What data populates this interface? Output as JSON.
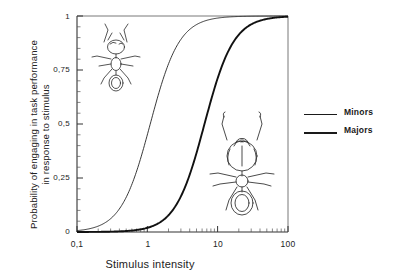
{
  "chart_data": {
    "type": "line",
    "title": "",
    "xlabel": "Stimulus intensity",
    "ylabel_line1": "Probability of engaging in task performance",
    "ylabel_line2": "in response to stimulus",
    "xscale": "log",
    "xlim": [
      0.1,
      100
    ],
    "ylim": [
      0,
      1
    ],
    "grid": false,
    "legend_position": "right",
    "xticks": [
      "0,1",
      "1",
      "10",
      "100"
    ],
    "xtick_values": [
      0.1,
      1,
      10,
      100
    ],
    "yticks": [
      "0",
      "0,25",
      "0,5",
      "0,75",
      "1"
    ],
    "ytick_values": [
      0,
      0.25,
      0.5,
      0.75,
      1
    ],
    "series": [
      {
        "name": "Minors",
        "threshold": 1.1,
        "steepness": 2.1,
        "linewidth": "thin",
        "color": "#222222",
        "x": [
          0.1,
          0.15,
          0.2,
          0.3,
          0.4,
          0.5,
          0.7,
          0.9,
          1.1,
          1.4,
          1.8,
          2.2,
          3.0,
          4.0,
          6.0,
          10.0,
          20.0,
          50.0,
          100.0
        ],
        "y": [
          0.01,
          0.02,
          0.04,
          0.09,
          0.15,
          0.22,
          0.36,
          0.45,
          0.5,
          0.61,
          0.72,
          0.79,
          0.88,
          0.93,
          0.97,
          0.99,
          1.0,
          1.0,
          1.0
        ]
      },
      {
        "name": "Majors",
        "threshold": 6.5,
        "steepness": 2.1,
        "linewidth": "thick",
        "color": "#111111",
        "x": [
          0.1,
          0.3,
          0.6,
          1.0,
          1.5,
          2.0,
          3.0,
          4.0,
          5.0,
          6.5,
          8.0,
          10.0,
          14.0,
          20.0,
          30.0,
          50.0,
          70.0,
          100.0
        ],
        "y": [
          0.0,
          0.0,
          0.01,
          0.02,
          0.04,
          0.07,
          0.14,
          0.23,
          0.33,
          0.5,
          0.62,
          0.72,
          0.84,
          0.91,
          0.96,
          0.99,
          0.99,
          1.0
        ]
      }
    ],
    "annotations": [
      {
        "name": "minor-ant-illustration",
        "label": "Minor worker ant line drawing",
        "x": 0.4,
        "y": 0.82
      },
      {
        "name": "major-ant-illustration",
        "label": "Major soldier ant line drawing",
        "x": 22.0,
        "y": 0.33
      }
    ]
  },
  "legend": {
    "items": [
      {
        "label": "Minors",
        "style": "thin"
      },
      {
        "label": "Majors",
        "style": "thick"
      }
    ]
  },
  "colors": {
    "axis": "#222222",
    "curve_minors": "#222222",
    "curve_majors": "#111111",
    "background": "#ffffff"
  }
}
